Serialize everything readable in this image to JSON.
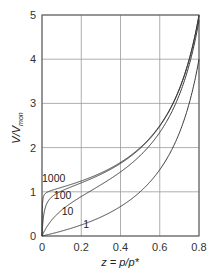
{
  "chart_data": {
    "type": "line",
    "title": "",
    "xlabel": "z = p/p*",
    "ylabel": "V/V_mon",
    "ylabel_main": "V/V",
    "ylabel_sub": "mon",
    "xlim": [
      0,
      0.8
    ],
    "ylim": [
      0,
      5
    ],
    "grid": true,
    "legend": "inline curve labels",
    "x_ticks": [
      "0",
      "0.2",
      "0.4",
      "0.6",
      "0.8"
    ],
    "y_ticks": [
      "0",
      "1",
      "2",
      "3",
      "4",
      "5"
    ],
    "x_tick_values": [
      0,
      0.2,
      0.4,
      0.6,
      0.8
    ],
    "y_tick_values": [
      0,
      1,
      2,
      3,
      4,
      5
    ],
    "formula": "V/V_mon = c*z / ((1 - z) * (1 - z + c*z))",
    "series": [
      {
        "name": "1",
        "c": 1,
        "label_pos": [
          0.2,
          0.17
        ],
        "x": [
          0,
          0.1,
          0.2,
          0.3,
          0.4,
          0.5,
          0.6,
          0.7,
          0.8
        ],
        "values": [
          0,
          0.11,
          0.25,
          0.43,
          0.67,
          1.0,
          1.5,
          2.33,
          4.0
        ]
      },
      {
        "name": "10",
        "c": 10,
        "label_pos": [
          0.09,
          0.48
        ],
        "x": [
          0,
          0.05,
          0.1,
          0.2,
          0.3,
          0.4,
          0.5,
          0.6,
          0.7,
          0.8
        ],
        "values": [
          0,
          0.36,
          0.58,
          0.89,
          1.15,
          1.46,
          1.82,
          2.31,
          3.0,
          4.76
        ]
      },
      {
        "name": "100",
        "c": 100,
        "label_pos": [
          0.05,
          0.84
        ],
        "x": [
          0,
          0.02,
          0.05,
          0.1,
          0.2,
          0.3,
          0.4,
          0.5,
          0.6,
          0.7,
          0.8
        ],
        "values": [
          0,
          0.68,
          0.89,
          1.01,
          1.18,
          1.4,
          1.62,
          1.96,
          2.47,
          3.26,
          4.97
        ]
      },
      {
        "name": "1000",
        "c": 1000,
        "label_pos": [
          0.0,
          1.22
        ],
        "x": [
          0,
          0.005,
          0.01,
          0.02,
          0.05,
          0.1,
          0.2,
          0.3,
          0.4,
          0.5,
          0.6,
          0.7,
          0.8
        ],
        "values": [
          0,
          0.84,
          0.92,
          0.98,
          1.05,
          1.11,
          1.25,
          1.43,
          1.66,
          2.0,
          2.5,
          3.33,
          5.0
        ]
      }
    ],
    "colors": {
      "curve": "#3a3a3a",
      "grid": "#9a9a9a",
      "axis": "#555555"
    }
  }
}
